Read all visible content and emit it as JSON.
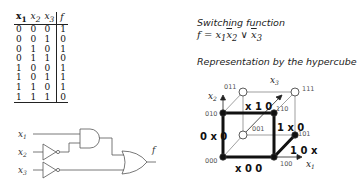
{
  "truth_table": {
    "headers": [
      "x1",
      "x2",
      "x3",
      "f"
    ],
    "rows": [
      [
        "0",
        "0",
        "0",
        "1"
      ],
      [
        "0",
        "0",
        "1",
        "0"
      ],
      [
        "0",
        "1",
        "0",
        "1"
      ],
      [
        "0",
        "1",
        "1",
        "0"
      ],
      [
        "1",
        "0",
        "0",
        "1"
      ],
      [
        "1",
        "0",
        "1",
        "1"
      ],
      [
        "1",
        "1",
        "0",
        "1"
      ],
      [
        "1",
        "1",
        "1",
        "0"
      ]
    ]
  },
  "switching_function": {
    "title": "Switching function",
    "formula_lhs": "f = x",
    "sub1": "1",
    "x2bar": "x",
    "sub2": "2",
    "or": " ∨ ",
    "x3bar": "x",
    "sub3": "3"
  },
  "hypercube": {
    "title": "Representation by the hypercube",
    "vertices": [
      {
        "label": "000",
        "value": 1
      },
      {
        "label": "001",
        "value": 0
      },
      {
        "label": "010",
        "value": 1
      },
      {
        "label": "011",
        "value": 0
      },
      {
        "label": "100",
        "value": 1
      },
      {
        "label": "101",
        "value": 1
      },
      {
        "label": "110",
        "value": 1
      },
      {
        "label": "111",
        "value": 0
      }
    ],
    "edge_labels": [
      "x 1 0",
      "1 x 0",
      "0 x 0",
      "1 0 x",
      "x 0 0"
    ],
    "axes": [
      "x1",
      "x2",
      "x3"
    ]
  },
  "circuit": {
    "inputs": [
      "x1",
      "x2",
      "x3"
    ],
    "output": "f",
    "gates": [
      "NOT",
      "NOT",
      "AND",
      "OR"
    ]
  }
}
